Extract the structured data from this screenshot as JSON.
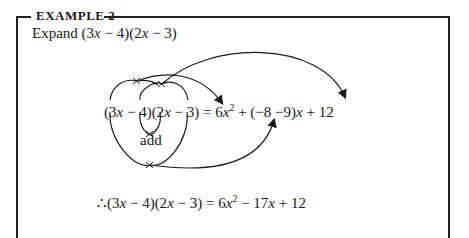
{
  "example": {
    "heading": "EXAMPLE 2",
    "task_prefix": "Expand ",
    "task_expr": "(3x − 4)(2x − 3)"
  },
  "diagram": {
    "lhs": "(3x − 4)(2x − 3)",
    "rhs_term1": "6x²",
    "rhs_middle": "(−8 −9)x",
    "rhs_term3": "12",
    "add_label": "add",
    "cross_marks": 4,
    "arrows": [
      {
        "from": "3x × 2x",
        "to": "6x²"
      },
      {
        "from": "−4 × −3",
        "to": "12"
      },
      {
        "from": "outer product (3x × −3)",
        "to": "middle term"
      },
      {
        "from": "inner product (−4 × 2x)",
        "to": "add"
      }
    ]
  },
  "result": {
    "therefore": "∴",
    "lhs": "(3x − 4)(2x − 3)",
    "rhs": "6x² − 17x + 12"
  }
}
